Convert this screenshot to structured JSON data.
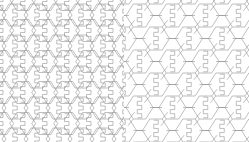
{
  "figure": {
    "kind": "geometric-tessellation-figure",
    "background_color": "#ffffff",
    "line_color": "#8a8a8a",
    "line_width_px": 0.55,
    "width_px": 249,
    "height_px": 142,
    "panel_count": 2,
    "text_labels": [],
    "axis_labels": [],
    "legend_entries": [],
    "annotations": []
  },
  "panels": [
    {
      "id": "left",
      "name": "dense-hexagon-tessellation",
      "x_px": 0,
      "y_px": 0,
      "width_px": 124,
      "height_px": 142,
      "tiling": {
        "cell_shape": "hexagon",
        "packing": "edge-to-edge-dense",
        "columns": 5,
        "rows": 8,
        "cell_width_px": 26,
        "cell_height_px": 22,
        "column_step_px": 22,
        "row_step_px": 15.5,
        "row_offset_px": 7.75,
        "origin_x_px": 2,
        "origin_y_px": 4,
        "motif": "vertical-zigzag-step",
        "motif_steps": 5,
        "motif_amplitude_px": 4.5
      }
    },
    {
      "id": "right",
      "name": "sparse-linked-hexagon-tessellation",
      "x_px": 124,
      "y_px": 0,
      "width_px": 125,
      "height_px": 142,
      "tiling": {
        "cell_shape": "hexagon",
        "packing": "connected-by-straight-struts",
        "columns": 4,
        "rows": 6,
        "cell_width_px": 27,
        "cell_height_px": 23,
        "column_step_px": 33,
        "row_step_px": 23,
        "row_offset_px": 16.5,
        "origin_x_px": 2,
        "origin_y_px": 4,
        "strut_length_px": 9,
        "motif": "vertical-zigzag-step",
        "motif_steps": 5,
        "motif_amplitude_px": 4.5
      }
    }
  ]
}
